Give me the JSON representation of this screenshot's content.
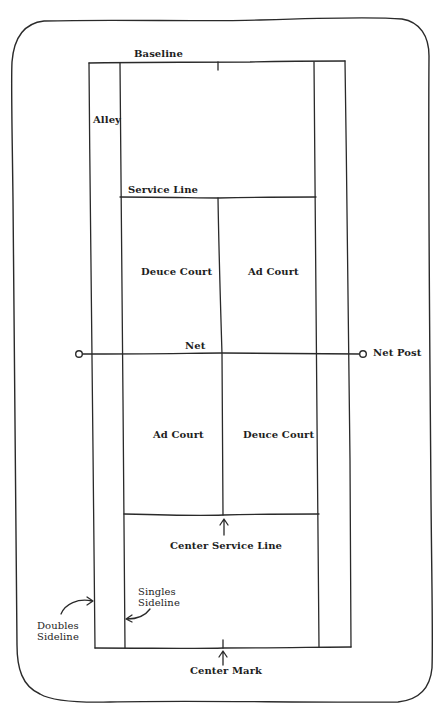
{
  "diagram": {
    "colors": {
      "line": "#2a2a2a",
      "text": "#1e1e1e",
      "background": "#ffffff"
    },
    "labels": {
      "baseline": "Baseline",
      "alley": "Alley",
      "service_line": "Service Line",
      "deuce_court_top": "Deuce Court",
      "ad_court_top": "Ad Court",
      "net": "Net",
      "net_post": "Net Post",
      "ad_court_bottom": "Ad Court",
      "deuce_court_bottom": "Deuce Court",
      "center_service_line": "Center Service Line",
      "singles_sideline": "Singles\nSideline",
      "doubles_sideline": "Doubles\nSideline",
      "center_mark": "Center Mark"
    },
    "court": {
      "doubles_left_x": 91,
      "singles_left_x": 121,
      "center_x": 219,
      "singles_right_x": 316,
      "doubles_right_x": 348,
      "top_baseline_y": 62,
      "top_service_line_y": 197,
      "net_y": 354,
      "bottom_service_line_y": 515,
      "bottom_baseline_y": 648,
      "net_post_left_x": 79,
      "net_post_right_x": 363
    }
  }
}
